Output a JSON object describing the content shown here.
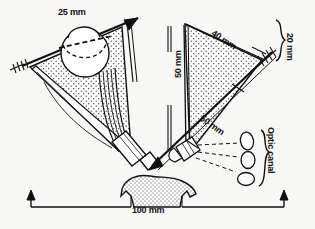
{
  "figure": {
    "type": "anatomical-line-drawing"
  },
  "measurements": {
    "orbit_height_25": "25 mm",
    "orbit_width_40": "40 mm",
    "orbit_depth_vertical_50": "50 mm",
    "orbit_depth_diagonal_50": "50 mm",
    "lateral_offset_20": "20 mm",
    "interorbital_base_100": "100 mm"
  },
  "annotations": {
    "optic_canal": "Optic canal"
  },
  "icons": {
    "arrow_up": "arrow-up-icon",
    "arrow_down": "arrow-down-icon",
    "feather_tail": "arrow-feather-tail-icon",
    "brace": "curly-brace-icon"
  },
  "colors": {
    "ink": "#111111",
    "paper": "#f7f7f5",
    "stipple": "#333333"
  }
}
